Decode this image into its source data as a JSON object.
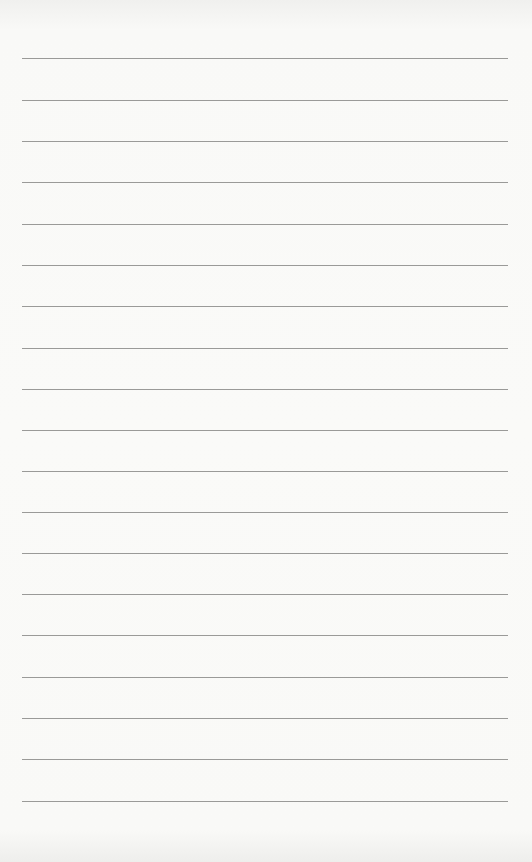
{
  "page": {
    "type": "lined-paper",
    "background_color": "#f8f8f6",
    "line_color": "#9a9a98",
    "line_count": 19,
    "line_left": 22,
    "line_right": 508,
    "line_positions_y": [
      58,
      100,
      141,
      182,
      224,
      265,
      306,
      348,
      389,
      430,
      471,
      512,
      553,
      594,
      635,
      677,
      718,
      759,
      801
    ]
  }
}
